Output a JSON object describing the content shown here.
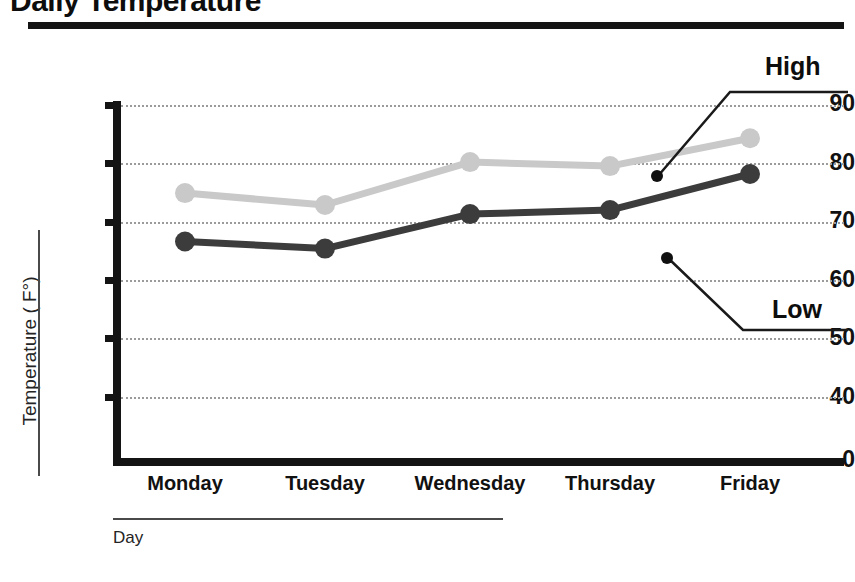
{
  "chart_data": {
    "type": "line",
    "title": "Daily Temperature",
    "xlabel": "Day",
    "ylabel": "Temperature ( F°)",
    "categories": [
      "Monday",
      "Tuesday",
      "Wednesday",
      "Thursday",
      "Friday"
    ],
    "ylim": [
      0,
      90
    ],
    "yticks": [
      90,
      80,
      70,
      60,
      50,
      40,
      0
    ],
    "ytick_labels": [
      "90",
      "80",
      "70",
      "60",
      "50",
      "40",
      "0"
    ],
    "grid": true,
    "legend_position": "annotations-right",
    "series": [
      {
        "name": "High",
        "color": "#c9c9c9",
        "values": [
          67.8,
          64.8,
          75.6,
          74.6,
          81.6
        ]
      },
      {
        "name": "Low",
        "color": "#3c3c3c",
        "values": [
          55.6,
          53.8,
          62.5,
          63.5,
          72.6
        ]
      }
    ],
    "annotations": [
      {
        "text": "High",
        "series": "High"
      },
      {
        "text": "Low",
        "series": "Low"
      }
    ]
  },
  "axis": {
    "y_tick_0": "90",
    "y_tick_1": "80",
    "y_tick_2": "70",
    "y_tick_3": "60",
    "y_tick_4": "50",
    "y_tick_5": "40",
    "y_tick_6": "0",
    "x_tick_0": "Monday",
    "x_tick_1": "Tuesday",
    "x_tick_2": "Wednesday",
    "x_tick_3": "Thursday",
    "x_tick_4": "Friday"
  },
  "labels": {
    "title": "Daily Temperature",
    "y_axis_caption": "Temperature ( F°)",
    "x_axis_caption": "Day",
    "callout_high": "High",
    "callout_low": "Low"
  },
  "colors": {
    "high_series": "#c9c9c9",
    "low_series": "#3c3c3c",
    "axis": "#141414",
    "grid": "#9b9b9b",
    "text": "#111111"
  }
}
